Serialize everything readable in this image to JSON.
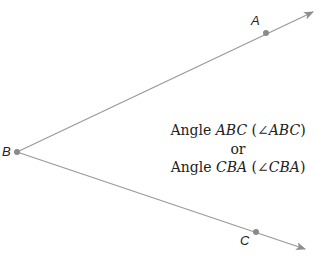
{
  "diagram": {
    "vertex": {
      "label": "B",
      "x": 17,
      "y": 152
    },
    "rays": [
      {
        "point_label": "A",
        "point": {
          "x": 266,
          "y": 33
        },
        "tip": {
          "x": 313,
          "y": 12
        }
      },
      {
        "point_label": "C",
        "point": {
          "x": 256,
          "y": 232
        },
        "tip": {
          "x": 305,
          "y": 249
        }
      }
    ],
    "line_color": "#9a9a9a",
    "point_color": "#8a8a8a",
    "caption": {
      "line1_word": "Angle",
      "line1_name": "ABC",
      "line1_symbol": "∠",
      "line1_name2": "ABC",
      "line2": "or",
      "line3_word": "Angle",
      "line3_name": "CBA",
      "line3_symbol": "∠",
      "line3_name2": "CBA"
    },
    "labels": {
      "A": "A",
      "B": "B",
      "C": "C"
    }
  }
}
